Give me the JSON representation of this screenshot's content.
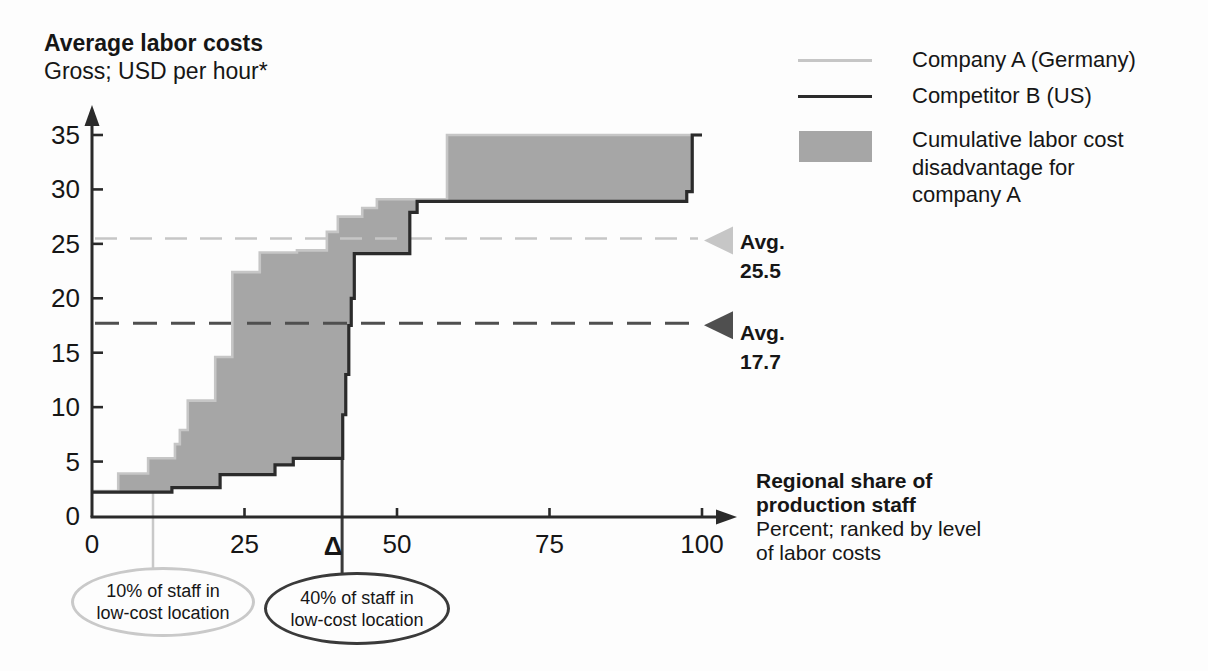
{
  "header": {
    "title": "Average labor costs",
    "subtitle": "Gross; USD per hour*"
  },
  "legend": {
    "items": [
      {
        "swatch": "line",
        "color": "#c6c6c6",
        "label": "Company A (Germany)"
      },
      {
        "swatch": "line",
        "color": "#2b2b2b",
        "label": "Competitor B (US)"
      },
      {
        "swatch": "box",
        "color": "#a6a6a6",
        "label": "Cumulative labor cost\ndisadvantage for\ncompany A"
      }
    ]
  },
  "chart_data": {
    "type": "area",
    "x_axis": {
      "title": "Regional share of\nproduction staff",
      "subtitle": "Percent; ranked by level\nof labor costs",
      "ticks": [
        "0",
        "25",
        "50",
        "75",
        "100"
      ],
      "range": [
        0,
        100
      ]
    },
    "y_axis": {
      "ticks": [
        "0",
        "5",
        "10",
        "15",
        "20",
        "25",
        "30",
        "35"
      ],
      "range": [
        0,
        35
      ]
    },
    "area_color": "#a6a6a6",
    "axis_color": "#2a2a2a",
    "series": [
      {
        "name": "Company A (Germany)",
        "color": "#c6c6c6",
        "average": 25.5,
        "steps": [
          [
            0,
            2.3
          ],
          [
            4.3,
            3.9
          ],
          [
            9.2,
            5.3
          ],
          [
            13.6,
            6.6
          ],
          [
            14.4,
            7.9
          ],
          [
            15.7,
            10.6
          ],
          [
            20.2,
            14.6
          ],
          [
            23,
            22.4
          ],
          [
            27.5,
            24.2
          ],
          [
            33.6,
            24.4
          ],
          [
            38.5,
            26.1
          ],
          [
            40.3,
            27.5
          ],
          [
            44.3,
            28.3
          ],
          [
            46.7,
            29.1
          ],
          [
            58.2,
            35
          ]
        ]
      },
      {
        "name": "Competitor B (US)",
        "color": "#2b2b2b",
        "average": 17.7,
        "steps": [
          [
            0,
            2.2
          ],
          [
            13.1,
            2.6
          ],
          [
            21,
            3.8
          ],
          [
            30,
            4.7
          ],
          [
            33,
            5.3
          ],
          [
            41.1,
            9.3
          ],
          [
            41.6,
            13
          ],
          [
            42.1,
            17.5
          ],
          [
            42.5,
            20
          ],
          [
            43,
            24.1
          ],
          [
            52.1,
            27.9
          ],
          [
            53.3,
            28.9
          ],
          [
            97.5,
            29.8
          ],
          [
            98.4,
            35
          ]
        ]
      }
    ],
    "averages": [
      {
        "series": "Company A (Germany)",
        "label": "Avg.",
        "value": "25.5",
        "color": "#c6c6c6",
        "dash": "22 13",
        "width": 2.5,
        "marker": "left-triangle"
      },
      {
        "series": "Competitor B (US)",
        "label": "Avg.",
        "value": "17.7",
        "color": "#4f4f4f",
        "dash": "24 14",
        "width": 3,
        "marker": "left-triangle"
      }
    ],
    "delta_symbol": "Δ",
    "callouts": [
      {
        "x": 10,
        "attach_y": 2.2,
        "color": "#c9c9c9",
        "text": "10% of staff in\nlow-cost location"
      },
      {
        "x": 41,
        "attach_y": 5.3,
        "color": "#3a3a3a",
        "text": "40% of staff in\nlow-cost location"
      }
    ]
  }
}
